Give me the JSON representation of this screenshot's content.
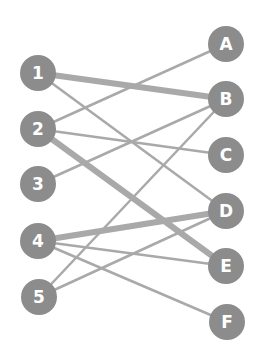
{
  "colors": {
    "background": "#ffffff",
    "node_fill": "#8c8c8c",
    "edge": "#a9a9a9",
    "label": "#ffffff"
  },
  "node_radius": 18,
  "left_nodes": [
    {
      "id": "1",
      "label": "1",
      "x": 38,
      "y": 73
    },
    {
      "id": "2",
      "label": "2",
      "x": 38,
      "y": 129
    },
    {
      "id": "3",
      "label": "3",
      "x": 38,
      "y": 184
    },
    {
      "id": "4",
      "label": "4",
      "x": 38,
      "y": 241
    },
    {
      "id": "5",
      "label": "5",
      "x": 39,
      "y": 297
    }
  ],
  "right_nodes": [
    {
      "id": "A",
      "label": "A",
      "x": 226,
      "y": 44
    },
    {
      "id": "B",
      "label": "B",
      "x": 226,
      "y": 99
    },
    {
      "id": "C",
      "label": "C",
      "x": 226,
      "y": 155
    },
    {
      "id": "D",
      "label": "D",
      "x": 226,
      "y": 211
    },
    {
      "id": "E",
      "label": "E",
      "x": 226,
      "y": 266
    },
    {
      "id": "F",
      "label": "F",
      "x": 227,
      "y": 322
    }
  ],
  "edges": [
    {
      "from": "1",
      "to": "B",
      "weight": "thick"
    },
    {
      "from": "1",
      "to": "D",
      "weight": "thin"
    },
    {
      "from": "2",
      "to": "A",
      "weight": "thin"
    },
    {
      "from": "2",
      "to": "C",
      "weight": "thin"
    },
    {
      "from": "2",
      "to": "E",
      "weight": "thick"
    },
    {
      "from": "3",
      "to": "B",
      "weight": "thin"
    },
    {
      "from": "4",
      "to": "D",
      "weight": "thick"
    },
    {
      "from": "4",
      "to": "E",
      "weight": "thin"
    },
    {
      "from": "4",
      "to": "F",
      "weight": "thin"
    },
    {
      "from": "5",
      "to": "B",
      "weight": "thin"
    },
    {
      "from": "5",
      "to": "D",
      "weight": "thin"
    }
  ]
}
